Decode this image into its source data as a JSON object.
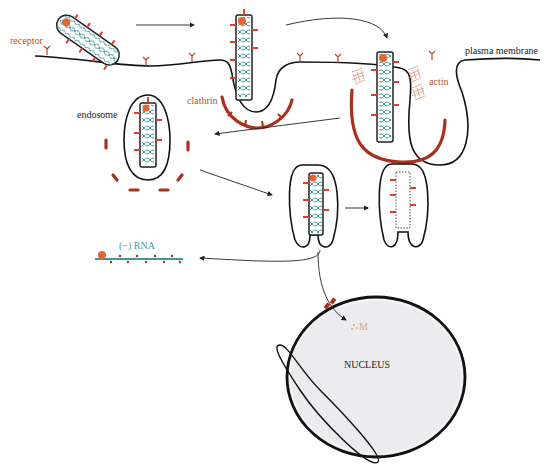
{
  "diagram": {
    "labels": {
      "receptor": "receptor",
      "plasma_membrane": "plasma membrane",
      "clathrin": "clathrin",
      "actin": "actin",
      "endosome": "endosome",
      "rna": "(−) RNA",
      "m": "M",
      "nucleus": "NUCLEUS"
    },
    "stages": [
      "virion binds receptor",
      "clathrin-coated pit",
      "actin-assisted invagination",
      "endosome",
      "fusion / uncoating",
      "empty envelope",
      "RNA release",
      "M protein to nucleus"
    ],
    "colors": {
      "membrane": "#111111",
      "spike": "#d8412a",
      "clathrin": "#a8301e",
      "rna_coil": "#3a9a9a",
      "label_brown": "#b5542c",
      "label_teal": "#4a9a9a",
      "nucleus_fill": "#ececef"
    }
  }
}
